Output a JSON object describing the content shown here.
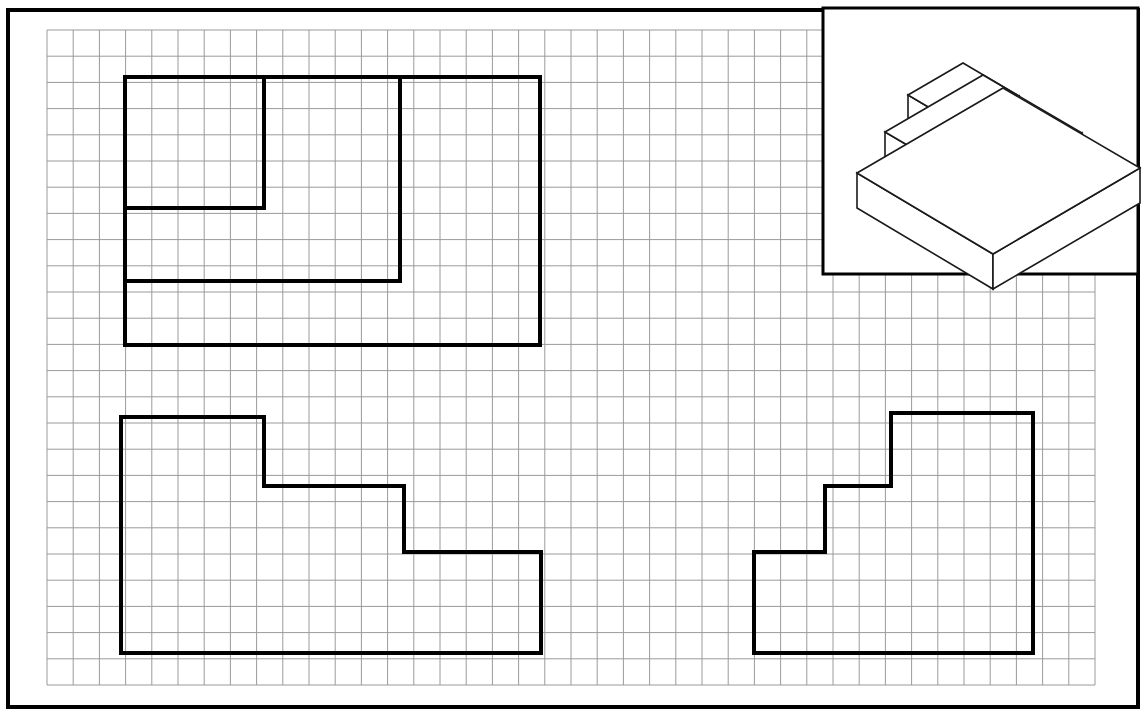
{
  "sheet": {
    "title": "Orthographic Views Worksheet — Stepped Pyramid",
    "background_color": "#ffffff",
    "border_color": "#000000",
    "grid_color": "#9a9a9a",
    "object_line_color": "#000000",
    "border": {
      "x": 8,
      "y": 10,
      "width": 1130,
      "height": 697,
      "stroke_width": 4
    }
  },
  "grid": {
    "label": "square-grid",
    "origin_x": 47,
    "origin_y": 30,
    "cell_size": 26.2,
    "columns": 40,
    "rows": 25,
    "stroke_width": 1,
    "visible": true
  },
  "pictorial_inset": {
    "label": "isometric-pictorial-view",
    "box": {
      "x": 823,
      "y": 8,
      "width": 315,
      "height": 266,
      "stroke_width": 3
    },
    "object_name": "three-tier-stepped-pyramid",
    "tier_count": 3,
    "line_color": "#1a1a1a",
    "line_width": 1.6,
    "fill_color": "#ffffff",
    "tiers": [
      {
        "name": "bottom-slab",
        "top_face": [
          [
            857,
            173
          ],
          [
            1003,
            88
          ],
          [
            1140,
            168
          ],
          [
            993,
            254
          ]
        ],
        "left_face": [
          [
            857,
            173
          ],
          [
            857,
            208
          ],
          [
            993,
            289
          ],
          [
            993,
            254
          ]
        ],
        "right_face": [
          [
            993,
            254
          ],
          [
            993,
            289
          ],
          [
            1140,
            203
          ],
          [
            1140,
            168
          ]
        ]
      },
      {
        "name": "middle-slab",
        "top_face": [
          [
            885,
            132
          ],
          [
            983,
            75
          ],
          [
            1082,
            133
          ],
          [
            984,
            190
          ]
        ],
        "left_face": [
          [
            885,
            132
          ],
          [
            885,
            161
          ],
          [
            984,
            219
          ],
          [
            984,
            190
          ]
        ],
        "right_face": [
          [
            984,
            190
          ],
          [
            984,
            219
          ],
          [
            1082,
            162
          ],
          [
            1082,
            133
          ]
        ]
      },
      {
        "name": "top-slab",
        "top_face": [
          [
            908,
            95
          ],
          [
            963,
            63
          ],
          [
            1019,
            96
          ],
          [
            964,
            128
          ]
        ],
        "left_face": [
          [
            908,
            95
          ],
          [
            908,
            119
          ],
          [
            964,
            152
          ],
          [
            964,
            128
          ]
        ],
        "right_face": [
          [
            964,
            128
          ],
          [
            964,
            152
          ],
          [
            1019,
            120
          ],
          [
            1019,
            96
          ]
        ]
      }
    ]
  },
  "views": [
    {
      "name": "top-view",
      "position": "upper-left",
      "line_width": 4,
      "description": "Plan view showing nested rectangular steps",
      "outline_points": [
        [
          125,
          77
        ],
        [
          540,
          77
        ],
        [
          540,
          345
        ],
        [
          125,
          345
        ]
      ],
      "interior_lines": [
        {
          "name": "step-line-1-vertical",
          "points": [
            [
              400,
              77
            ],
            [
              400,
              281
            ]
          ]
        },
        {
          "name": "step-line-1-horizontal",
          "points": [
            [
              125,
              281
            ],
            [
              400,
              281
            ]
          ]
        },
        {
          "name": "step-line-2-vertical",
          "points": [
            [
              264,
              77
            ],
            [
              264,
              208
            ]
          ]
        },
        {
          "name": "step-line-2-horizontal",
          "points": [
            [
              125,
              208
            ],
            [
              264,
              208
            ]
          ]
        }
      ]
    },
    {
      "name": "front-view",
      "position": "lower-left",
      "line_width": 4,
      "description": "Front elevation showing three stacked rectangular steps",
      "outline_points": [
        [
          121,
          417
        ],
        [
          264,
          417
        ],
        [
          264,
          486
        ],
        [
          404,
          486
        ],
        [
          404,
          552
        ],
        [
          541,
          552
        ],
        [
          541,
          653
        ],
        [
          121,
          653
        ]
      ],
      "interior_lines": []
    },
    {
      "name": "right-side-view",
      "position": "lower-right",
      "line_width": 4,
      "description": "Right side elevation, mirrored step profile",
      "outline_points": [
        [
          891,
          413
        ],
        [
          1033,
          413
        ],
        [
          1033,
          653
        ],
        [
          754,
          653
        ],
        [
          754,
          552
        ],
        [
          825,
          552
        ],
        [
          825,
          486
        ],
        [
          891,
          486
        ]
      ],
      "interior_lines": []
    }
  ]
}
